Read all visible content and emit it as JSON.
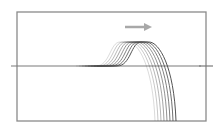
{
  "diagram": {
    "frame": {
      "x1": 17,
      "y1": 12,
      "x2": 206,
      "y2": 121,
      "color": "#8a8a8a"
    },
    "axis": {
      "y": 66,
      "x1": 11,
      "x2": 201,
      "color": "#7a7a7a"
    },
    "right_tick": {
      "x1": 199,
      "x2": 213,
      "y": 66
    },
    "arrow": {
      "x1": 125,
      "x2": 152,
      "y": 27,
      "color": "#a8a8a8",
      "direction": "right"
    },
    "curves": {
      "count": 8,
      "plateau_y": 42,
      "baseline_y": 66,
      "bottom_y": 121,
      "rise_start_x": [
        96,
        99,
        102,
        105,
        108,
        111,
        114,
        117
      ],
      "peak_x": [
        128,
        131,
        134,
        137,
        140,
        143,
        146,
        149
      ],
      "end_x": [
        155,
        158,
        161,
        164,
        167,
        170,
        173,
        176
      ],
      "opacity": [
        0.2,
        0.3,
        0.4,
        0.5,
        0.6,
        0.7,
        0.8,
        0.95
      ]
    }
  }
}
